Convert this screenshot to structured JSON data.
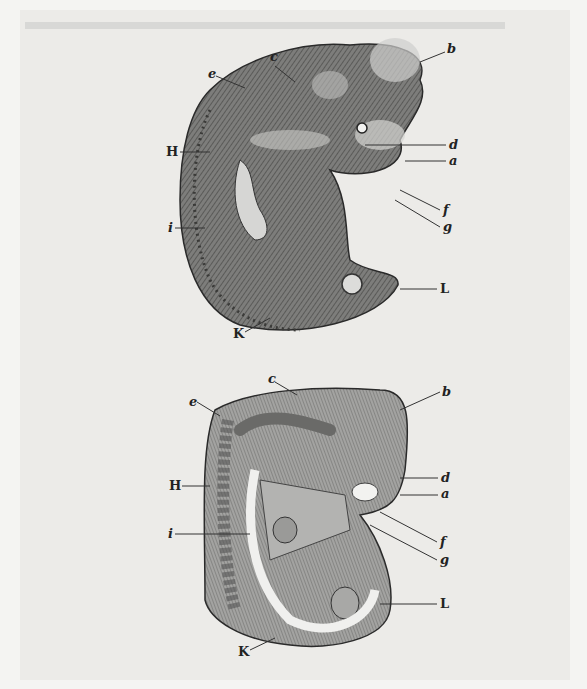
{
  "colors": {
    "paper": "#ecebe8",
    "ink": "#2a2a2a",
    "mid": "#8a8a88",
    "light": "#bdbdbb"
  },
  "figures": [
    {
      "name": "upper-embryo",
      "labels": [
        {
          "text": "c",
          "x": 270,
          "y": 58
        },
        {
          "text": "b",
          "x": 447,
          "y": 50
        },
        {
          "text": "e",
          "x": 211,
          "y": 74
        },
        {
          "text": "H",
          "x": 166,
          "y": 147
        },
        {
          "text": "d",
          "x": 449,
          "y": 141
        },
        {
          "text": "a",
          "x": 449,
          "y": 157
        },
        {
          "text": "f",
          "x": 443,
          "y": 206
        },
        {
          "text": "g",
          "x": 443,
          "y": 224
        },
        {
          "text": "i",
          "x": 169,
          "y": 223
        },
        {
          "text": "L",
          "x": 440,
          "y": 283
        },
        {
          "text": "K",
          "x": 233,
          "y": 330
        }
      ]
    },
    {
      "name": "lower-embryo",
      "labels": [
        {
          "text": "c",
          "x": 270,
          "y": 376
        },
        {
          "text": "b",
          "x": 442,
          "y": 388
        },
        {
          "text": "e",
          "x": 190,
          "y": 398
        },
        {
          "text": "H",
          "x": 169,
          "y": 481
        },
        {
          "text": "d",
          "x": 441,
          "y": 473
        },
        {
          "text": "a",
          "x": 441,
          "y": 490
        },
        {
          "text": "f",
          "x": 440,
          "y": 538
        },
        {
          "text": "g",
          "x": 440,
          "y": 556
        },
        {
          "text": "i",
          "x": 169,
          "y": 528
        },
        {
          "text": "L",
          "x": 440,
          "y": 599
        },
        {
          "text": "K",
          "x": 239,
          "y": 648
        }
      ]
    }
  ]
}
